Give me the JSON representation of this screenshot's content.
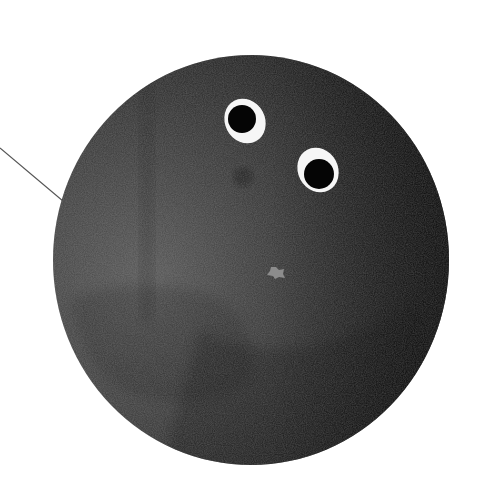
{
  "image": {
    "width": 489,
    "height": 492,
    "background": "#ffffff",
    "description": "Dark speckled sphere with two googly eyes"
  },
  "colors": {
    "sphere_light": "#5e5e5e",
    "sphere_mid": "#3a3a3a",
    "sphere_dark": "#0e0e0e",
    "eye_white": "#f6f6f6",
    "pupil": "#050505",
    "spot": "#8c8c8c",
    "pointer_line": "#555555"
  },
  "sphere": {
    "cx": 251,
    "cy": 260,
    "rx": 198,
    "ry": 205
  },
  "eyes": [
    {
      "name": "left-eye",
      "cx": 245,
      "cy": 121,
      "rx": 20,
      "ry": 23,
      "rotate": -28,
      "pupil_cx": 242,
      "pupil_cy": 119,
      "pupil_r": 14
    },
    {
      "name": "right-eye",
      "cx": 318,
      "cy": 170,
      "rx": 20,
      "ry": 23,
      "rotate": -28,
      "pupil_cx": 319,
      "pupil_cy": 174,
      "pupil_r": 15
    }
  ],
  "spot": {
    "cx": 276,
    "cy": 273
  },
  "pointer_line": {
    "x1": 0,
    "y1": 148,
    "x2": 95,
    "y2": 228
  }
}
